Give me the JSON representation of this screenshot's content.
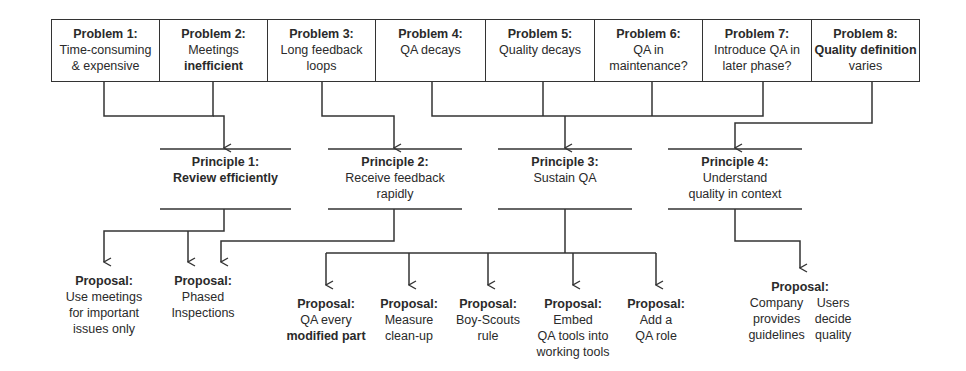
{
  "problems": [
    {
      "title": "Problem 1:",
      "line1": "Time-consuming",
      "line2": "& expensive",
      "bold_part": ""
    },
    {
      "title": "Problem 2:",
      "line1": "Meetings",
      "line2": "",
      "bold_part": "inefficient"
    },
    {
      "title": "Problem 3:",
      "line1": "Long feedback",
      "line2": "loops",
      "bold_part": ""
    },
    {
      "title": "Problem 4:",
      "line1": "QA decays",
      "line2": "",
      "bold_part": ""
    },
    {
      "title": "Problem 5:",
      "line1": "Quality decays",
      "line2": "",
      "bold_part": ""
    },
    {
      "title": "Problem 6:",
      "line1": "QA in",
      "line2": "maintenance?",
      "bold_part": ""
    },
    {
      "title": "Problem 7:",
      "line1": "Introduce QA in",
      "line2": "later phase?",
      "bold_part": ""
    },
    {
      "title": "Problem 8:",
      "line1": "varies",
      "line2": "",
      "bold_part": "Quality definition"
    }
  ],
  "principles": [
    {
      "title": "Principle 1:",
      "line1": "Review efficiently",
      "line2": "",
      "bold_body": true
    },
    {
      "title": "Principle 2:",
      "line1": "Receive feedback",
      "line2": "rapidly",
      "bold_body": false
    },
    {
      "title": "Principle 3:",
      "line1": "Sustain QA",
      "line2": "",
      "bold_body": false
    },
    {
      "title": "Principle 4:",
      "line1": "Understand",
      "line2": "quality in context",
      "bold_body": false
    }
  ],
  "proposals": [
    {
      "title": "Proposal:",
      "lines": [
        "Use meetings",
        "for important",
        "issues only"
      ]
    },
    {
      "title": "Proposal:",
      "lines": [
        "Phased",
        "Inspections"
      ]
    },
    {
      "title": "Proposal:",
      "lines": [
        "QA every"
      ],
      "bold_line": "modified part"
    },
    {
      "title": "Proposal:",
      "lines": [
        "Measure",
        "clean-up"
      ]
    },
    {
      "title": "Proposal:",
      "lines": [
        "Boy-Scouts",
        "rule"
      ]
    },
    {
      "title": "Proposal:",
      "lines": [
        "Embed",
        "QA tools into",
        "working tools"
      ]
    },
    {
      "title": "Proposal:",
      "lines": [
        "Add a",
        "QA role"
      ]
    },
    {
      "title": "Proposal:",
      "left_lines": [
        "Company",
        "provides",
        "guidelines"
      ],
      "right_lines": [
        "Users",
        "decide",
        "quality"
      ]
    }
  ],
  "colors": {
    "line": "#333333",
    "text": "#2a2a2a",
    "background": "#ffffff"
  }
}
